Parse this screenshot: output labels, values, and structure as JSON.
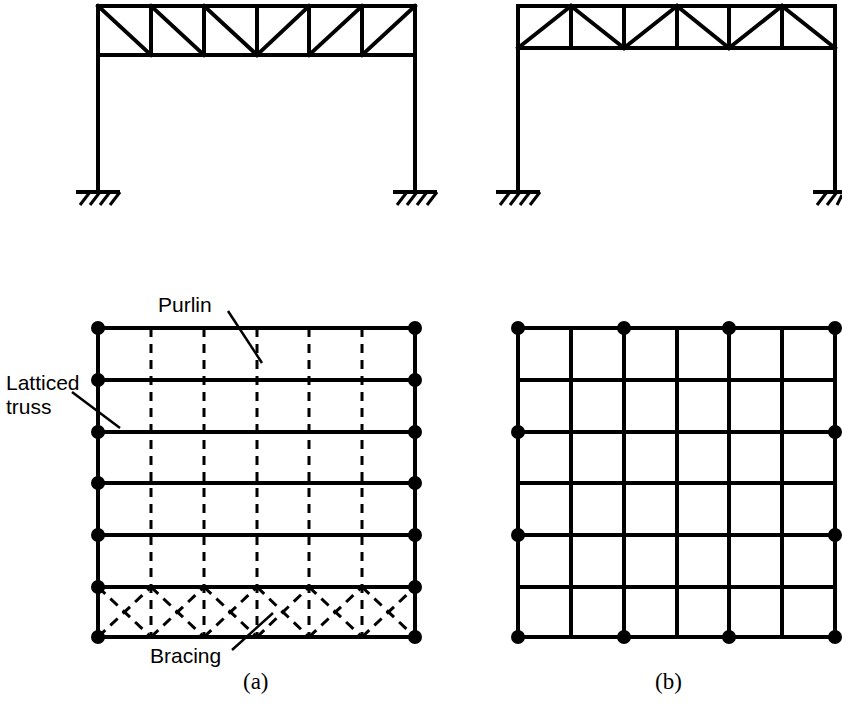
{
  "figure": {
    "ink_color": "#000000",
    "background_color": "#ffffff",
    "labels": {
      "purlin": "Purlin",
      "latticed_truss_line1": "Latticed",
      "latticed_truss_line2": "truss",
      "bracing": "Bracing"
    },
    "captions": {
      "a": "(a)",
      "b": "(b)"
    }
  },
  "elevation_a": {
    "name": "portal-frame-elevation-a",
    "truss_type": "lattice-girder-with-single-diagonals",
    "panels": 6,
    "panel_direction_left": "top-left-to-bottom-right",
    "panel_direction_right": "bottom-left-to-top-right",
    "support_type": "fixed",
    "supports": 2,
    "geometry": {
      "left_x": 98,
      "right_x": 415,
      "top_chord_y": 5,
      "bottom_chord_y": 55,
      "base_y": 192
    }
  },
  "elevation_b": {
    "name": "portal-frame-elevation-b",
    "truss_type": "warren-truss-with-verticals",
    "panels": 6,
    "support_type": "fixed",
    "supports": 2,
    "geometry": {
      "left_x": 518,
      "right_x": 835,
      "top_chord_y": 5,
      "bottom_chord_y": 48,
      "base_y": 192
    }
  },
  "plan_a": {
    "name": "roof-plan-a",
    "truss_lines": 7,
    "purlin_lines": 5,
    "purlin_style": "dashed",
    "truss_style": "solid",
    "bracing_bays": 6,
    "bracing_style": "dashed-cross",
    "bracing_location": "bottom-bay",
    "node_count": 14,
    "geometry": {
      "left_x": 98,
      "right_x": 415,
      "top_y": 328,
      "bottom_y": 637
    }
  },
  "plan_b": {
    "name": "roof-plan-b",
    "grid_rows": 6,
    "grid_cols": 6,
    "line_style": "solid",
    "node_spacing": 2,
    "node_count": 16,
    "geometry": {
      "left_x": 518,
      "right_x": 835,
      "top_y": 328,
      "bottom_y": 637
    }
  }
}
